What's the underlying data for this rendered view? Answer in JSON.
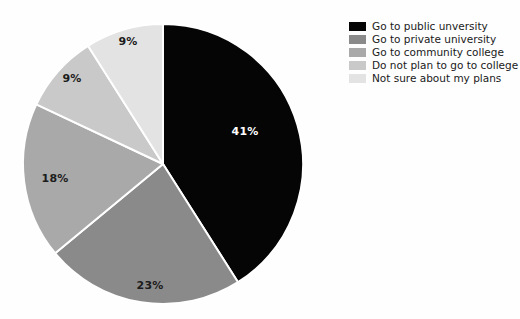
{
  "figure": {
    "background_color": "#fefefe",
    "label_text_color_dark": "#1c1c1c",
    "label_text_color_light": "#ffffff",
    "separator_color": "#ffffff"
  },
  "legend": {
    "position": "top-right",
    "items": [
      {
        "label": "Go to public unversity",
        "color": "#050505",
        "swatch_name": "legend-swatch-public-university"
      },
      {
        "label": "Go to private university",
        "color": "#8a8a8a",
        "swatch_name": "legend-swatch-private-university"
      },
      {
        "label": "Go to community college",
        "color": "#a9a9a9",
        "swatch_name": "legend-swatch-community-college"
      },
      {
        "label": "Do not plan to go to college",
        "color": "#c9c9c9",
        "swatch_name": "legend-swatch-no-college"
      },
      {
        "label": "Not sure about my plans",
        "color": "#e3e3e3",
        "swatch_name": "legend-swatch-not-sure"
      }
    ]
  },
  "chart_data": {
    "type": "pie",
    "title": "",
    "subtitle": "",
    "xlabel": "",
    "ylabel": "",
    "grid": false,
    "legend_position": "top-right",
    "start_angle_deg": 90,
    "direction": "clockwise",
    "center": {
      "x": 163,
      "y": 164
    },
    "radius": 140,
    "labels": [
      "Go to public unversity",
      "Go to private university",
      "Go to community college",
      "Do not plan to go to college",
      "Not sure about my plans"
    ],
    "values": [
      41,
      23,
      18,
      9,
      9
    ],
    "value_unit": "%",
    "data_labels": [
      "41%",
      "23%",
      "18%",
      "9%",
      "9%"
    ],
    "colors": [
      "#050505",
      "#8a8a8a",
      "#a9a9a9",
      "#c9c9c9",
      "#e3e3e3"
    ],
    "slices": [
      {
        "label": "Go to public unversity",
        "value": 41,
        "data_label": "41%",
        "color": "#050505",
        "label_color": "light",
        "label_x": 245,
        "label_y": 135
      },
      {
        "label": "Go to private university",
        "value": 23,
        "data_label": "23%",
        "color": "#8a8a8a",
        "label_color": "dark",
        "label_x": 150,
        "label_y": 289
      },
      {
        "label": "Go to community college",
        "value": 18,
        "data_label": "18%",
        "color": "#a9a9a9",
        "label_color": "dark",
        "label_x": 55,
        "label_y": 182
      },
      {
        "label": "Do not plan to go to college",
        "value": 9,
        "data_label": "9%",
        "color": "#c9c9c9",
        "label_color": "dark",
        "label_x": 72,
        "label_y": 82
      },
      {
        "label": "Not sure about my plans",
        "value": 9,
        "data_label": "9%",
        "color": "#e3e3e3",
        "label_color": "dark",
        "label_x": 128,
        "label_y": 45
      }
    ]
  }
}
